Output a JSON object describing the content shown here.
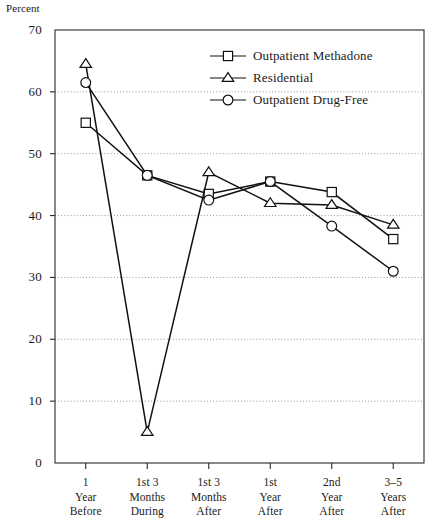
{
  "chart_data": {
    "type": "line",
    "title": "",
    "subtitle": "",
    "ylabel": "Percent",
    "xlabel": "",
    "ylim": [
      0,
      70
    ],
    "yticks": [
      0,
      10,
      20,
      30,
      40,
      50,
      60,
      70
    ],
    "ytick_labels": [
      "0",
      "10",
      "20",
      "30",
      "40",
      "50",
      "60",
      "70"
    ],
    "grid": true,
    "grid_axis": "y",
    "legend_position": "top-center-right",
    "categories": [
      "1 Year Before",
      "1st 3 Months During",
      "1st 3 Months After",
      "1st Year After",
      "2nd Year After",
      "3-5 Years After"
    ],
    "category_lines": [
      [
        "1",
        "Year",
        "Before"
      ],
      [
        "1st 3",
        "Months",
        "During"
      ],
      [
        "1st 3",
        "Months",
        "After"
      ],
      [
        "1st",
        "Year",
        "After"
      ],
      [
        "2nd",
        "Year",
        "After"
      ],
      [
        "3–5",
        "Years",
        "After"
      ]
    ],
    "series": [
      {
        "name": "Outpatient Methadone",
        "marker": "square",
        "values": [
          55.0,
          46.5,
          43.5,
          45.5,
          43.8,
          36.2
        ]
      },
      {
        "name": "Residential",
        "marker": "triangle",
        "values": [
          64.5,
          5.0,
          47.0,
          42.0,
          41.7,
          38.5
        ]
      },
      {
        "name": "Outpatient Drug-Free",
        "marker": "circle",
        "values": [
          61.5,
          46.5,
          42.5,
          45.5,
          38.3,
          31.0
        ]
      }
    ]
  },
  "colors": {
    "line": "#111111",
    "grid": "#8c8c8c",
    "frame": "#2b2b2b",
    "text": "#1a1a1a",
    "marker_fill": "#ffffff"
  }
}
